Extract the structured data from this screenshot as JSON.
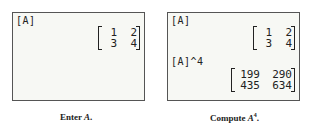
{
  "screen1": {
    "label": "[A]",
    "matrix": [
      [
        "1",
        "2"
      ],
      [
        "3",
        "4"
      ]
    ],
    "caption_prefix": "Enter ",
    "caption_var": "A",
    "caption_suffix": "."
  },
  "screen2": {
    "label1": "[A]",
    "matrix1": [
      [
        "1",
        "2"
      ],
      [
        "3",
        "4"
      ]
    ],
    "label2": "[A]^4",
    "matrix2": [
      [
        "199",
        "290"
      ],
      [
        "435",
        "634"
      ]
    ],
    "caption_prefix": "Compute ",
    "caption_var": "A",
    "caption_sup": "4",
    "caption_suffix": "."
  }
}
